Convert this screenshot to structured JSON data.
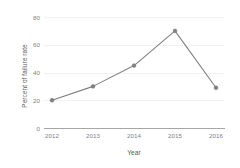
{
  "chart_data": {
    "type": "line",
    "title": "",
    "xlabel": "Year",
    "ylabel": "Percent of failure rate",
    "categories": [
      "2012",
      "2013",
      "2014",
      "2015",
      "2016"
    ],
    "values": [
      20,
      30,
      45,
      70,
      29
    ],
    "series": [
      {
        "name": "Percent of failure rate",
        "values": [
          20,
          30,
          45,
          70,
          29
        ]
      }
    ],
    "yticks": [
      "80",
      "60",
      "40",
      "20",
      "0"
    ],
    "ytick_values": [
      80,
      60,
      40,
      20,
      0
    ],
    "ylim": [
      0,
      80
    ],
    "xlim": [
      2012,
      2016
    ],
    "grid": "horizontal",
    "legend": "none",
    "marker": "circle",
    "colors": {
      "line": "#808080",
      "marker": "#808080",
      "grid": "#f2f2f2",
      "axis": "#a6a6a6",
      "tick_text": "#7f7f7f",
      "label_text": "#595959",
      "background": "#ffffff"
    }
  }
}
